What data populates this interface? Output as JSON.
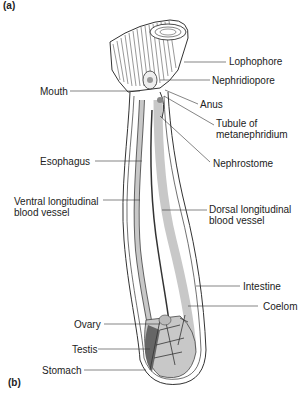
{
  "figure": {
    "panel_a": "(a)",
    "panel_b": "(b)"
  },
  "labels": {
    "lophophore": "Lophophore",
    "nephridiopore": "Nephridiopore",
    "mouth": "Mouth",
    "anus": "Anus",
    "tubule_line1": "Tubule of",
    "tubule_line2": "metanephridium",
    "nephrostome": "Nephrostome",
    "esophagus": "Esophagus",
    "ventral_line1": "Ventral longitudinal",
    "ventral_line2": "blood vessel",
    "dorsal_line1": "Dorsal longitudinal",
    "dorsal_line2": "blood vessel",
    "intestine": "Intestine",
    "coelom": "Coelom",
    "ovary": "Ovary",
    "testis": "Testis",
    "stomach": "Stomach"
  },
  "colors": {
    "outline": "#333333",
    "fill_gut": "#c8c8c8",
    "fill_dark": "#555555",
    "leader": "#333333"
  }
}
